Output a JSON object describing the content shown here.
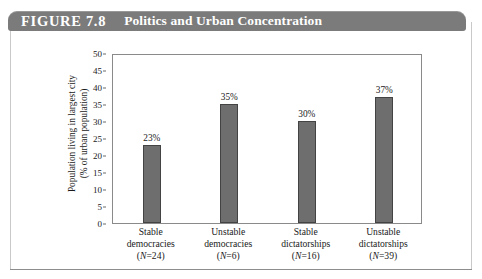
{
  "figure": {
    "label": "FIGURE 7.8",
    "title": "Politics and Urban Concentration"
  },
  "colors": {
    "banner": "#7b7b7b",
    "bar_fill": "#6e6e6e",
    "bar_border": "#434343",
    "frame": "#8a8a8a",
    "text": "#1a1a1a"
  },
  "chart_data": {
    "type": "bar",
    "title": "Politics and Urban Concentration",
    "xlabel": "",
    "ylabel": "Population living in largest city (% of urban population)",
    "ylabel_line1": "Population living in largest city",
    "ylabel_line2": "(% of urban population)",
    "ylim": [
      0,
      50
    ],
    "yticks": [
      50,
      45,
      40,
      35,
      30,
      25,
      20,
      15,
      10,
      5,
      0
    ],
    "grid": false,
    "legend": "none",
    "categories": [
      "Stable democracies",
      "Unstable democracies",
      "Stable dictatorships",
      "Unstable dictatorships"
    ],
    "category_lines": [
      [
        "Stable",
        "democracies"
      ],
      [
        "Unstable",
        "democracies"
      ],
      [
        "Stable",
        "dictatorships"
      ],
      [
        "Unstable",
        "dictatorships"
      ]
    ],
    "sample_sizes": [
      24,
      6,
      16,
      39
    ],
    "sample_size_labels": [
      "(N=24)",
      "(N=6)",
      "(N=16)",
      "(N=39)"
    ],
    "values": [
      23,
      35,
      30,
      37
    ],
    "value_labels": [
      "23%",
      "35%",
      "30%",
      "37%"
    ]
  }
}
